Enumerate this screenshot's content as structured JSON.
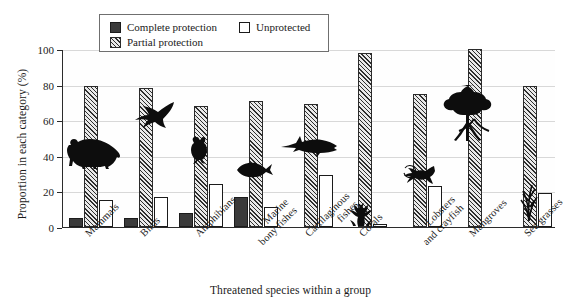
{
  "chart_data": {
    "type": "bar",
    "title": "",
    "xlabel": "Threatened species within a group",
    "ylabel": "Proportion in each category (%)",
    "ylim": [
      0,
      100
    ],
    "yticks": [
      "0",
      "20",
      "40",
      "60",
      "80",
      "100"
    ],
    "grid": true,
    "legend_position": "top-center",
    "categories": [
      "Mammals",
      "Birds",
      "Amphibians",
      "Marine\nbony fishes",
      "Cartilaginous\nfishes",
      "Corals",
      "Lobsters\nand crayfish",
      "Mangroves",
      "Sea grasses"
    ],
    "series": [
      {
        "name": "Complete protection",
        "color": "#3a3a3a",
        "values": [
          5,
          5,
          8,
          17,
          0,
          0,
          0,
          0,
          0
        ]
      },
      {
        "name": "Partial protection",
        "color": "#8e8e8e",
        "values": [
          79,
          78,
          68,
          71,
          69,
          98,
          75,
          100,
          79
        ]
      },
      {
        "name": "Unprotected",
        "color": "#ffffff",
        "values": [
          15,
          17,
          24,
          11,
          29,
          1.5,
          23,
          0,
          19
        ]
      }
    ],
    "icons": [
      "bear-silhouette",
      "bird-silhouette",
      "frog-silhouette",
      "fish-silhouette",
      "shark-silhouette",
      "coral-silhouette",
      "lobster-silhouette",
      "mangrove-silhouette",
      "seagrass-silhouette"
    ]
  },
  "legend": {
    "items": [
      {
        "label": "Complete protection",
        "swatch": "solid-dark"
      },
      {
        "label": "Partial protection",
        "swatch": "hatched"
      },
      {
        "label": "Unprotected",
        "swatch": "white-outline"
      }
    ]
  }
}
